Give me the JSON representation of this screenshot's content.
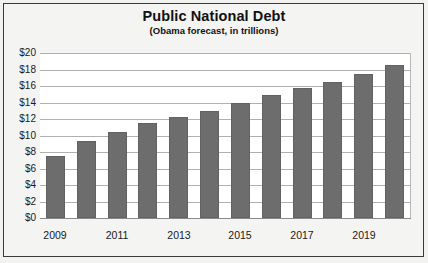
{
  "chart_data": {
    "type": "bar",
    "title": "Public National Debt",
    "subtitle": "(Obama forecast, in trillions)",
    "xlabel": "",
    "ylabel": "",
    "categories": [
      "2009",
      "2010",
      "2011",
      "2012",
      "2013",
      "2014",
      "2015",
      "2016",
      "2017",
      "2018",
      "2019",
      "2020"
    ],
    "values": [
      7.5,
      9.3,
      10.4,
      11.5,
      12.2,
      13.0,
      14.0,
      14.9,
      15.7,
      16.5,
      17.5,
      18.6
    ],
    "ylim": [
      0,
      20
    ],
    "ytick_step": 2,
    "ytick_labels": [
      "$20",
      "$18",
      "$16",
      "$14",
      "$12",
      "$10",
      "$8",
      "$6",
      "$4",
      "$2",
      "$0"
    ],
    "ytick_values": [
      20,
      18,
      16,
      14,
      12,
      10,
      8,
      6,
      4,
      2,
      0
    ],
    "xtick_labels": [
      "2009",
      "2011",
      "2013",
      "2015",
      "2017",
      "2019"
    ],
    "xtick_categories": [
      "2009",
      "2011",
      "2013",
      "2015",
      "2017",
      "2019"
    ],
    "grid": true,
    "legend": false,
    "legend_position": "none",
    "bar_color": "#6d6d6d",
    "gridline_color": "#b0b0b0",
    "plot_background": "#ffffff",
    "frame_background": "#f4f4f2",
    "border_color": "#3a3a3a",
    "text_color": "#1a1a1a"
  }
}
